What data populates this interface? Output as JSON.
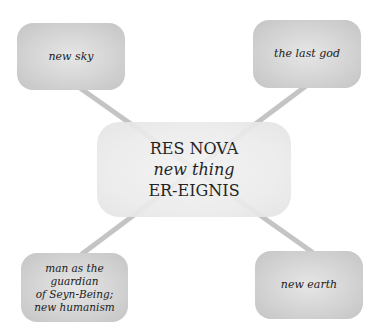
{
  "diagram": {
    "center": {
      "line1": "RES NOVA",
      "line2": "new thing",
      "line3": "ER-EIGNIS"
    },
    "nodes": {
      "top_left": "new sky",
      "top_right": "the last god",
      "bottom_left": [
        "man as the guardian",
        "of Seyn-Being;",
        "new humanism"
      ],
      "bottom_right": "new earth"
    },
    "colors": {
      "node_fill": "#d2d2d2",
      "center_fill": "#ececec",
      "connector": "#c8c8c8"
    }
  }
}
